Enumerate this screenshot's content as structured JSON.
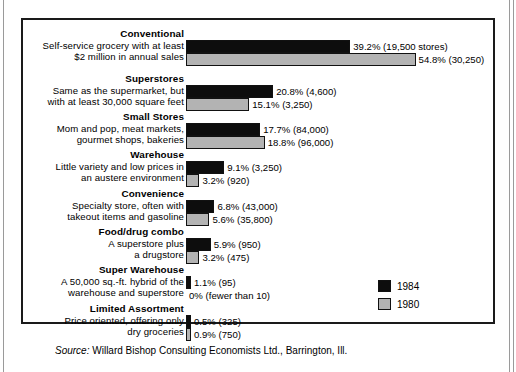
{
  "chart_data": {
    "type": "bar",
    "title": "",
    "orientation": "horizontal",
    "xlabel": "",
    "ylabel": "",
    "grid": false,
    "legend_position": "bottom-right",
    "legend": [
      "1984",
      "1980"
    ],
    "value_unit": "percent of total sales",
    "categories": [
      "Conventional",
      "Superstores",
      "Small Stores",
      "Warehouse",
      "Convenience",
      "Food/drug combo",
      "Super Warehouse",
      "Limited Assortment"
    ],
    "series": [
      {
        "name": "1984",
        "values": [
          39.2,
          20.8,
          17.7,
          9.1,
          6.8,
          5.9,
          1.1,
          0.5
        ],
        "counts": [
          19500,
          4600,
          84000,
          3250,
          43000,
          950,
          95,
          325
        ]
      },
      {
        "name": "1980",
        "values": [
          54.8,
          15.1,
          18.8,
          3.2,
          5.6,
          3.2,
          0.0,
          0.9
        ],
        "counts": [
          30250,
          3250,
          96000,
          920,
          35800,
          475,
          null,
          750
        ]
      }
    ]
  },
  "chart": {
    "rows": [
      {
        "category": "Conventional",
        "desc_line1": "Self-service grocery with at least",
        "desc_line2": "$2 million in annual sales",
        "bar1984": {
          "pct": 39.2,
          "label": "39.2%  (19,500 stores)"
        },
        "bar1980": {
          "pct": 54.8,
          "label": "54.8%  (30,250)"
        }
      },
      {
        "category": "Superstores",
        "desc_line1": "Same as the supermarket, but",
        "desc_line2": "with at least 30,000 square feet",
        "bar1984": {
          "pct": 20.8,
          "label": "20.8%  (4,600)"
        },
        "bar1980": {
          "pct": 15.1,
          "label": "15.1%  (3,250)"
        }
      },
      {
        "category": "Small Stores",
        "desc_line1": "Mom and pop, meat markets,",
        "desc_line2": "gourmet shops, bakeries",
        "bar1984": {
          "pct": 17.7,
          "label": "17.7%  (84,000)"
        },
        "bar1980": {
          "pct": 18.8,
          "label": "18.8%  (96,000)"
        }
      },
      {
        "category": "Warehouse",
        "desc_line1": "Little variety and low prices in",
        "desc_line2": "an austere environment",
        "bar1984": {
          "pct": 9.1,
          "label": "9.1%  (3,250)"
        },
        "bar1980": {
          "pct": 3.2,
          "label": "3.2%  (920)"
        }
      },
      {
        "category": "Convenience",
        "desc_line1": "Specialty store, often with",
        "desc_line2": "takeout items and gasoline",
        "bar1984": {
          "pct": 6.8,
          "label": "6.8%  (43,000)"
        },
        "bar1980": {
          "pct": 5.6,
          "label": "5.6%  (35,800)"
        }
      },
      {
        "category": "Food/drug combo",
        "desc_line1": "A superstore plus",
        "desc_line2": "a drugstore",
        "bar1984": {
          "pct": 5.9,
          "label": "5.9%  (950)"
        },
        "bar1980": {
          "pct": 3.2,
          "label": "3.2%  (475)"
        }
      },
      {
        "category": "Super Warehouse",
        "desc_line1": "A 50,000 sq.-ft. hybrid of the",
        "desc_line2": "warehouse and superstore",
        "bar1984": {
          "pct": 1.1,
          "label": "1.1%  (95)"
        },
        "bar1980": {
          "pct": 0.0,
          "label": "0%  (fewer than 10)"
        }
      },
      {
        "category": "Limited Assortment",
        "desc_line1": "Price oriented, offering only",
        "desc_line2": "dry groceries",
        "bar1984": {
          "pct": 0.5,
          "label": "0.5%  (325)"
        },
        "bar1980": {
          "pct": 0.9,
          "label": "0.9%  (750)"
        }
      }
    ],
    "legend": [
      {
        "label": "1984",
        "color": "#0d0d0d"
      },
      {
        "label": "1980",
        "color": "#b3b3b3"
      }
    ]
  },
  "source": {
    "prefix": "Source:",
    "text": " Willard Bishop Consulting Economists Ltd., Barrington, Ill."
  },
  "colors": {
    "bar_1984": "#0d0d0d",
    "bar_1980": "#b3b3b3",
    "frame": "#1a1a1a",
    "text": "#000000"
  }
}
